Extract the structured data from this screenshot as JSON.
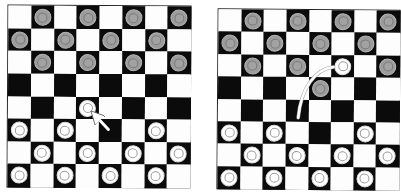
{
  "figure": {
    "colors": {
      "dark_square": "#0b0b0b",
      "light_square": "#fdfdfd",
      "dark_piece": "#9c9c9c",
      "light_piece": "#ffffff",
      "arrow": "#ffffff"
    }
  },
  "boards": [
    {
      "id": "left",
      "rows": 8,
      "cols": 8,
      "pieces": [
        {
          "row": 0,
          "col": 1,
          "color": "dark"
        },
        {
          "row": 0,
          "col": 3,
          "color": "dark"
        },
        {
          "row": 0,
          "col": 5,
          "color": "dark"
        },
        {
          "row": 0,
          "col": 7,
          "color": "dark"
        },
        {
          "row": 1,
          "col": 0,
          "color": "dark"
        },
        {
          "row": 1,
          "col": 2,
          "color": "dark"
        },
        {
          "row": 1,
          "col": 4,
          "color": "dark"
        },
        {
          "row": 1,
          "col": 6,
          "color": "dark"
        },
        {
          "row": 2,
          "col": 1,
          "color": "dark"
        },
        {
          "row": 2,
          "col": 3,
          "color": "dark"
        },
        {
          "row": 2,
          "col": 5,
          "color": "dark"
        },
        {
          "row": 2,
          "col": 7,
          "color": "dark"
        },
        {
          "row": 4,
          "col": 3,
          "color": "light"
        },
        {
          "row": 5,
          "col": 0,
          "color": "light"
        },
        {
          "row": 5,
          "col": 2,
          "color": "light"
        },
        {
          "row": 5,
          "col": 6,
          "color": "light"
        },
        {
          "row": 6,
          "col": 1,
          "color": "light"
        },
        {
          "row": 6,
          "col": 3,
          "color": "light"
        },
        {
          "row": 6,
          "col": 5,
          "color": "light"
        },
        {
          "row": 6,
          "col": 7,
          "color": "light"
        },
        {
          "row": 7,
          "col": 0,
          "color": "light"
        },
        {
          "row": 7,
          "col": 2,
          "color": "light"
        },
        {
          "row": 7,
          "col": 4,
          "color": "light"
        },
        {
          "row": 7,
          "col": 6,
          "color": "light"
        }
      ],
      "move": {
        "type": "straight",
        "from": {
          "row": 5,
          "col": 4
        },
        "to": {
          "row": 4,
          "col": 3
        }
      }
    },
    {
      "id": "right",
      "rows": 8,
      "cols": 8,
      "pieces": [
        {
          "row": 0,
          "col": 1,
          "color": "dark"
        },
        {
          "row": 0,
          "col": 3,
          "color": "dark"
        },
        {
          "row": 0,
          "col": 5,
          "color": "dark"
        },
        {
          "row": 0,
          "col": 7,
          "color": "dark"
        },
        {
          "row": 1,
          "col": 0,
          "color": "dark"
        },
        {
          "row": 1,
          "col": 2,
          "color": "dark"
        },
        {
          "row": 1,
          "col": 4,
          "color": "dark"
        },
        {
          "row": 1,
          "col": 6,
          "color": "dark"
        },
        {
          "row": 2,
          "col": 1,
          "color": "dark"
        },
        {
          "row": 2,
          "col": 3,
          "color": "dark"
        },
        {
          "row": 2,
          "col": 5,
          "color": "light"
        },
        {
          "row": 2,
          "col": 7,
          "color": "dark"
        },
        {
          "row": 3,
          "col": 4,
          "color": "dark"
        },
        {
          "row": 5,
          "col": 0,
          "color": "light"
        },
        {
          "row": 5,
          "col": 2,
          "color": "light"
        },
        {
          "row": 5,
          "col": 6,
          "color": "light"
        },
        {
          "row": 6,
          "col": 1,
          "color": "light"
        },
        {
          "row": 6,
          "col": 3,
          "color": "light"
        },
        {
          "row": 6,
          "col": 5,
          "color": "light"
        },
        {
          "row": 6,
          "col": 7,
          "color": "light"
        },
        {
          "row": 7,
          "col": 0,
          "color": "light"
        },
        {
          "row": 7,
          "col": 2,
          "color": "light"
        },
        {
          "row": 7,
          "col": 4,
          "color": "light"
        },
        {
          "row": 7,
          "col": 6,
          "color": "light"
        }
      ],
      "move": {
        "type": "curved",
        "from": {
          "row": 4,
          "col": 3
        },
        "to": {
          "row": 2,
          "col": 5
        }
      }
    }
  ]
}
